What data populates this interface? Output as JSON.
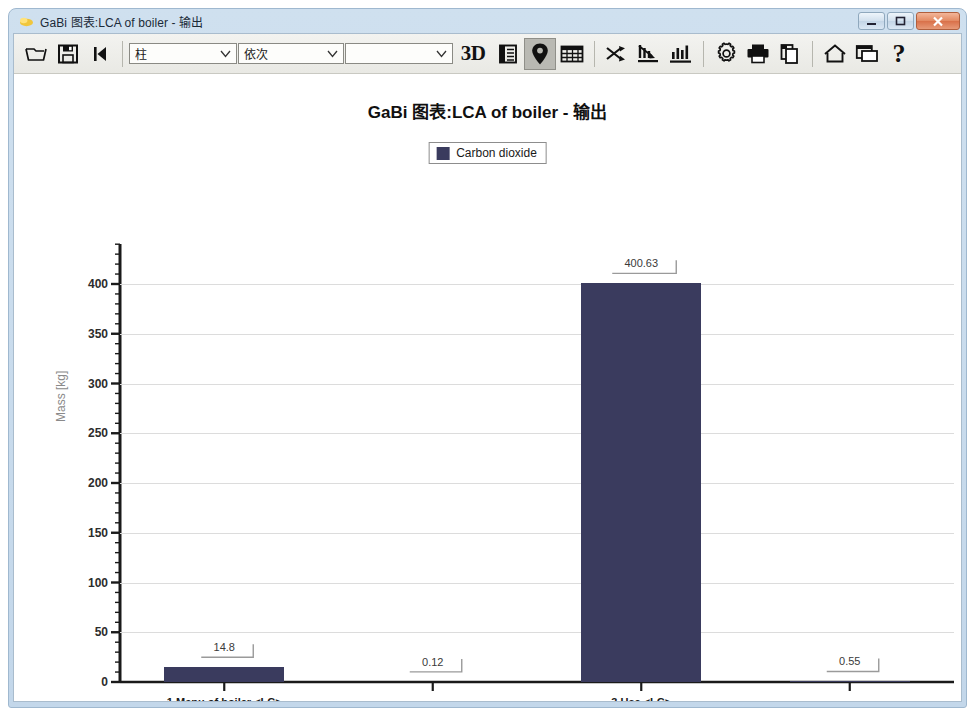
{
  "window": {
    "title": "GaBi 图表:LCA of boiler - 输出",
    "app_icon": "gabi-app-icon",
    "buttons": {
      "minimize": "minimize-button",
      "maximize": "maximize-button",
      "close": "close-button"
    }
  },
  "toolbar": {
    "open_label": "open-folder-icon",
    "save_label": "save-disk-icon",
    "first_label": "skip-to-start-icon",
    "combos": [
      {
        "name": "chart-type-select",
        "value": "柱"
      },
      {
        "name": "ordering-select",
        "value": "依次"
      },
      {
        "name": "filter-select",
        "value": ""
      }
    ],
    "icons": [
      {
        "name": "3d-view-button",
        "label": "3D",
        "active": false
      },
      {
        "name": "legend-table-button",
        "label": "",
        "active": false
      },
      {
        "name": "map-pin-button",
        "label": "",
        "active": true
      },
      {
        "name": "grid-table-button",
        "label": "",
        "active": false
      },
      {
        "name": "swap-axes-button",
        "label": "",
        "active": false
      },
      {
        "name": "descending-chart-button",
        "label": "",
        "active": false
      },
      {
        "name": "bar-chart-button",
        "label": "",
        "active": false
      },
      {
        "name": "settings-button",
        "label": "",
        "active": false
      },
      {
        "name": "print-button",
        "label": "",
        "active": false
      },
      {
        "name": "copy-button",
        "label": "",
        "active": false
      },
      {
        "name": "home-button",
        "label": "",
        "active": false
      },
      {
        "name": "window-button",
        "label": "",
        "active": false
      },
      {
        "name": "help-button",
        "label": "?",
        "active": false
      }
    ]
  },
  "chart_data": {
    "type": "bar",
    "title": "GaBi 图表:LCA of boiler - 输出",
    "xlabel": "",
    "ylabel": "Mass [kg]",
    "categories": [
      "1.Manu of boiler <LC>",
      "2.Transport <LC>",
      "3.Use <LC>",
      "4.Disposal <LC>"
    ],
    "values": [
      14.8,
      0.12,
      400.63,
      0.55
    ],
    "value_labels": [
      "14.8",
      "0.12",
      "400.63",
      "0.55"
    ],
    "series": [
      {
        "name": "Carbon dioxide",
        "values": [
          14.8,
          0.12,
          400.63,
          0.55
        ],
        "color": "#3a3b5e"
      }
    ],
    "legend": [
      "Carbon dioxide"
    ],
    "legend_position": "top-center",
    "ylim": [
      0,
      420
    ],
    "yticks": [
      0,
      50,
      100,
      150,
      200,
      250,
      300,
      350,
      400
    ],
    "ytick_labels": [
      "0",
      "50",
      "100",
      "150",
      "200",
      "250",
      "300",
      "350",
      "400"
    ],
    "minor_tick_step": 10,
    "grid": true
  }
}
